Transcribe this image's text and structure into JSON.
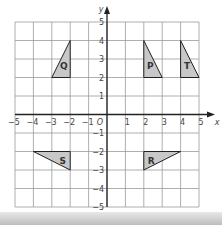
{
  "diagram": {
    "type": "coordinate-grid",
    "x_axis": {
      "label": "x",
      "min": -5,
      "max": 5,
      "ticks": [
        "-5",
        "-4",
        "-3",
        "-2",
        "-1",
        "1",
        "2",
        "3",
        "4",
        "5"
      ]
    },
    "y_axis": {
      "label": "y",
      "min": -5,
      "max": 5,
      "ticks": [
        "5",
        "4",
        "3",
        "2",
        "1",
        "-1",
        "-2",
        "-3",
        "-4",
        "-5"
      ]
    },
    "origin_label": "O",
    "colors": {
      "grid": "#9a9a9a",
      "axis": "#222222",
      "shape_fill": "#c8c8c8",
      "shape_stroke": "#222222",
      "text": "#333333"
    },
    "shapes": [
      {
        "label": "Q",
        "vertices": [
          [
            -2,
            4
          ],
          [
            -2,
            2
          ],
          [
            -3,
            2
          ]
        ],
        "label_pos": [
          -2.35,
          2.6
        ]
      },
      {
        "label": "P",
        "vertices": [
          [
            2,
            4
          ],
          [
            2,
            2
          ],
          [
            3,
            2
          ]
        ],
        "label_pos": [
          2.35,
          2.6
        ]
      },
      {
        "label": "T",
        "vertices": [
          [
            4,
            4
          ],
          [
            4,
            2
          ],
          [
            5,
            2
          ]
        ],
        "label_pos": [
          4.35,
          2.6
        ]
      },
      {
        "label": "S",
        "vertices": [
          [
            -4,
            -2
          ],
          [
            -2,
            -2
          ],
          [
            -2,
            -3
          ]
        ],
        "label_pos": [
          -2.4,
          -2.55
        ]
      },
      {
        "label": "R",
        "vertices": [
          [
            2,
            -3
          ],
          [
            2,
            -2
          ],
          [
            4,
            -2
          ]
        ],
        "label_pos": [
          2.4,
          -2.55
        ]
      }
    ]
  }
}
